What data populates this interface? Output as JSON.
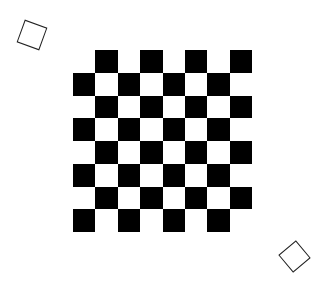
{
  "diagram": {
    "title": "",
    "board": {
      "rows": 8,
      "cols": 8,
      "left": 73,
      "top": 50,
      "cell_w": 22.4,
      "cell_h": 22.75,
      "dark_color": "#000000",
      "light_color": "#ffffff",
      "dark_parity": "odd",
      "removed_cells": [
        [
          0,
          0
        ],
        [
          7,
          7
        ]
      ]
    },
    "loose_tiles": [
      {
        "name": "loose-tile-top-left",
        "cx": 32,
        "cy": 35,
        "size": 24,
        "rotation_deg": 20
      },
      {
        "name": "loose-tile-bottom-right",
        "cx": 294,
        "cy": 256,
        "size": 23,
        "rotation_deg": 50
      }
    ]
  }
}
